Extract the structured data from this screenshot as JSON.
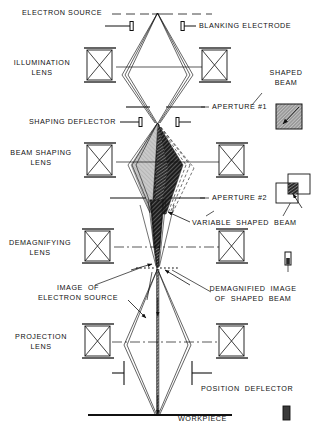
{
  "figure": {
    "type": "schematic-diagram"
  },
  "labels": {
    "electron_source": "ELECTRON SOURCE",
    "blanking_electrode": "BLANKING ELECTRODE",
    "illumination_lens": "ILLUMINATION\nLENS",
    "shaped_beam": "SHAPED\nBEAM",
    "aperture_1": "APERTURE #1",
    "shaping_deflector": "SHAPING DEFLECTOR",
    "beam_shaping_lens": "BEAM SHAPING\nLENS",
    "aperture_2": "APERTURE #2",
    "variable_shaped_beam": "VARIABLE  SHAPED  BEAM",
    "demagnifying_lens": "DEMAGNIFYING\nLENS",
    "image_of_electron_source": "IMAGE  OF\nELECTRON SOURCE",
    "demagnified_image_of_shaped_beam": "DEMAGNIFIED  IMAGE\nOF  SHAPED  BEAM",
    "projection_lens": "PROJECTION\nLENS",
    "position_deflector": "POSITION  DEFLECTOR",
    "workpiece": "WORKPIECE"
  },
  "colors": {
    "ink": "#111111",
    "ray": "#222222",
    "fill_dark": "#1b1b1b",
    "fill_light": "#b9b9b9",
    "fill_mid": "#8a8a8a"
  },
  "components": [
    {
      "name": "electron-source",
      "kind": "source-plane",
      "y": 14
    },
    {
      "name": "blanking-electrode",
      "kind": "deflector-pair",
      "y": 26
    },
    {
      "name": "illumination-lens",
      "kind": "magnetic-lens",
      "y": 67
    },
    {
      "name": "aperture-1",
      "kind": "aperture",
      "y": 107
    },
    {
      "name": "shaping-deflector",
      "kind": "deflector-pair",
      "y": 122
    },
    {
      "name": "beam-shaping-lens",
      "kind": "magnetic-lens",
      "y": 162
    },
    {
      "name": "aperture-2",
      "kind": "aperture",
      "y": 198
    },
    {
      "name": "demagnifying-lens",
      "kind": "magnetic-lens",
      "y": 248
    },
    {
      "name": "crossover-plane",
      "kind": "image-plane",
      "y": 268
    },
    {
      "name": "projection-lens",
      "kind": "magnetic-lens",
      "y": 343
    },
    {
      "name": "position-deflector",
      "kind": "deflector-pair",
      "y": 365
    },
    {
      "name": "workpiece",
      "kind": "target-plane",
      "y": 415
    }
  ],
  "insets": [
    {
      "name": "shaped-beam-inset",
      "shape": "filled-square-with-arrow"
    },
    {
      "name": "variable-shaped-beam-inset",
      "shape": "overlapping-squares"
    },
    {
      "name": "demagnified-image-inset",
      "shape": "small-vertical-bar"
    },
    {
      "name": "workpiece-spot-inset",
      "shape": "small-dark-bar"
    }
  ]
}
